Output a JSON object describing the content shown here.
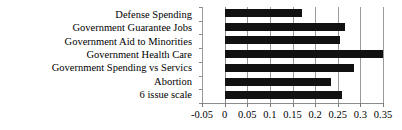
{
  "chart_data": {
    "type": "bar",
    "orientation": "horizontal",
    "title": "",
    "xlabel": "",
    "ylabel": "",
    "categories": [
      "Defense Spending",
      "Government Guarantee Jobs",
      "Government Aid to Minorities",
      "Government Health Care",
      "Government Spending vs Servics",
      "Abortion",
      "6 issue scale"
    ],
    "values": [
      0.17,
      0.267,
      0.256,
      0.35,
      0.285,
      0.235,
      0.26
    ],
    "xlim": [
      -0.05,
      0.35
    ],
    "xticks": [
      -0.05,
      0,
      0.05,
      0.1,
      0.15,
      0.2,
      0.25,
      0.3,
      0.35
    ],
    "xtick_labels": [
      "-0.05",
      "0",
      "0.05",
      "0.1",
      "0.15",
      "0.2",
      "0.25",
      "0.3",
      "0.35"
    ],
    "grid": true,
    "grid_axis": "x",
    "legend": null,
    "bar_color": "#111111",
    "grid_color": "#9a9a9a",
    "background_color": "#ffffff"
  }
}
